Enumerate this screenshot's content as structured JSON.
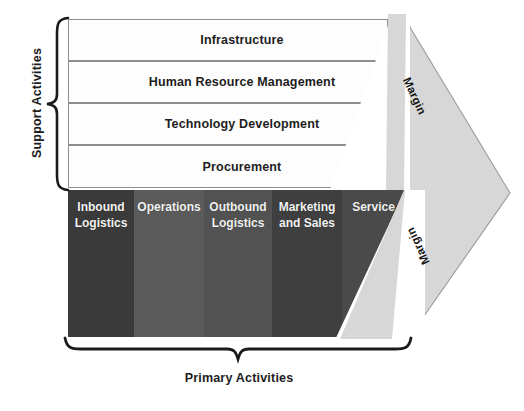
{
  "diagram": {
    "support_group_label": "Support Activities",
    "primary_group_label": "Primary Activities",
    "support_activities": [
      {
        "label": "Infrastructure"
      },
      {
        "label": "Human Resource Management"
      },
      {
        "label": "Technology Development"
      },
      {
        "label": "Procurement"
      }
    ],
    "primary_activities": [
      {
        "label": "Inbound\nLogistics",
        "color": "#3a3a3a"
      },
      {
        "label": "Operations",
        "color": "#5b5b5b"
      },
      {
        "label": "Outbound\nLogistics",
        "color": "#525252"
      },
      {
        "label": "Marketing\nand Sales",
        "color": "#3f3f3f"
      },
      {
        "label": "Service",
        "color": "#4a4a4a"
      }
    ],
    "margin": {
      "upper_label": "Margin",
      "lower_label": "Margin",
      "band_color": "#d7d7d7",
      "band_border_color": "#9a9a9a"
    },
    "colors": {
      "support_fill": "#fdfdfd",
      "support_border": "#8d8d8d",
      "text_dark": "#1d1d1d",
      "text_light": "#f2f2f2",
      "background": "#ffffff"
    }
  }
}
